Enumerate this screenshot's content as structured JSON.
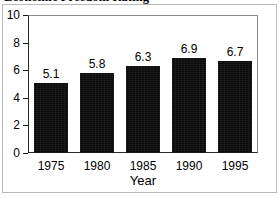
{
  "figure": {
    "title": "Economic Freedom Rating",
    "background_color": "#ffffff",
    "border_color": "#b9b9b9",
    "axis_color": "#1a1a1a"
  },
  "chart_data": {
    "type": "bar",
    "title": "Economic Freedom Rating",
    "categories": [
      "1975",
      "1980",
      "1985",
      "1990",
      "1995"
    ],
    "values": [
      5.1,
      5.8,
      6.3,
      6.9,
      6.7
    ],
    "value_labels": [
      "5.1",
      "5.8",
      "6.3",
      "6.9",
      "6.7"
    ],
    "xlabel": "Year",
    "ylabel": "",
    "ylim": [
      0,
      10
    ],
    "yticks": [
      0,
      2,
      4,
      6,
      8,
      10
    ],
    "ytick_labels": [
      "0",
      "2",
      "4",
      "6",
      "8",
      "10"
    ],
    "grid": false,
    "legend": false,
    "bar_color": "#0b0b0b"
  }
}
